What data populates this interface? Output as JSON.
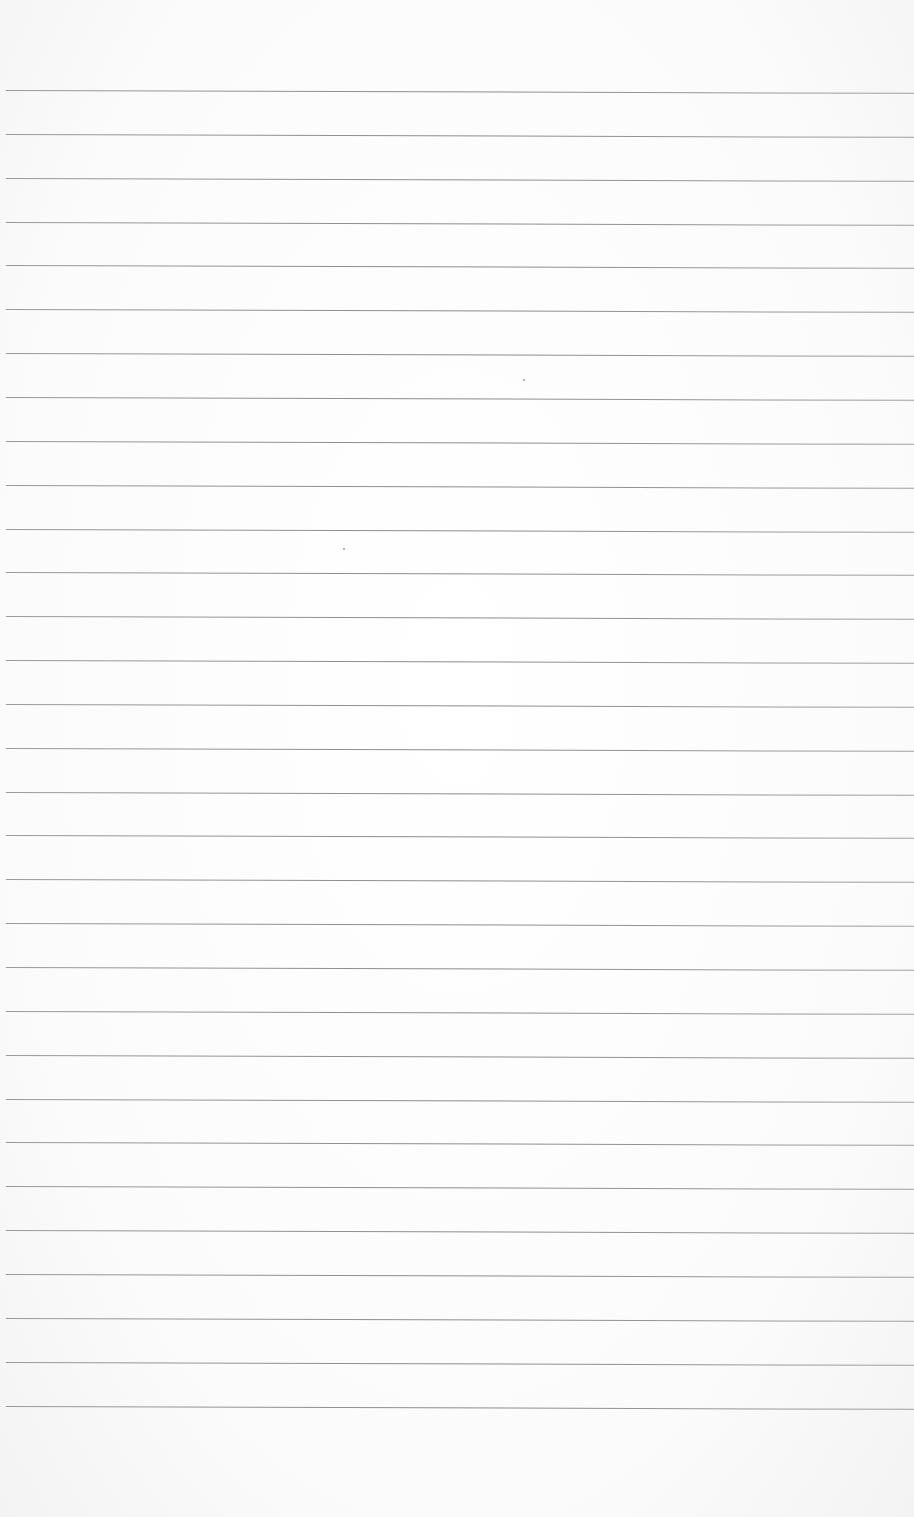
{
  "page": {
    "type": "ruled-paper",
    "background_color": "#fdfdfd",
    "line_color": "#8c8c8c",
    "line_count": 31,
    "first_line_y": 90,
    "line_spacing": 43.85,
    "line_left_x": 6
  },
  "text": ""
}
